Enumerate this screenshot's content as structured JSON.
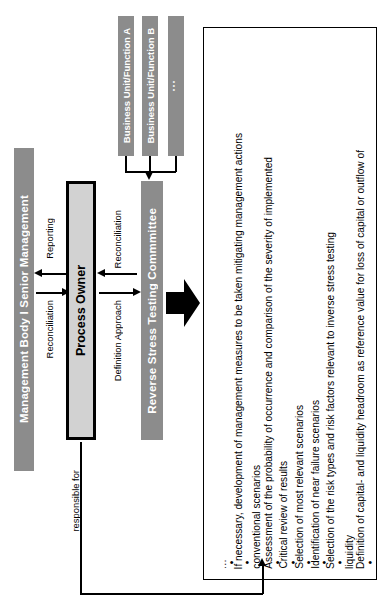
{
  "diagram": {
    "orientation": "rotated-90-ccw",
    "colors": {
      "grey_bar": "#8c8c8c",
      "process_owner_fill": "#d2d2d2",
      "outline": "#000000",
      "bar_text": "#ffffff"
    }
  },
  "management": {
    "label": "Management Body  I  Senior Management"
  },
  "process_owner": {
    "label": "Process Owner"
  },
  "committee": {
    "label": "Reverse Stress Testing Commmittee"
  },
  "business_units": [
    {
      "label": "Business Unit/Function A"
    },
    {
      "label": "Business Unit/Function B"
    },
    {
      "label": "..."
    }
  ],
  "connectors": {
    "reporting": "Reporting",
    "reconciliation_top": "Reconciliation",
    "definition_approach": "Definition Approach",
    "reconciliation_bottom": "Reconciliation",
    "responsible_for": "responsible for"
  },
  "activities": {
    "bullets": [
      {
        "bullet": "•",
        "text": "Definition of capital- and liquidity headroom as reference value for loss of capital or outflow of"
      },
      {
        "bullet": "",
        "text": "liquidity"
      },
      {
        "bullet": "•",
        "text": "Selection of the risk types and risk factors relevant to inverse stress testing"
      },
      {
        "bullet": "•",
        "text": "Identification of near failure scenarios"
      },
      {
        "bullet": "•",
        "text": "Selection of most relevant scenarios"
      },
      {
        "bullet": "•",
        "text": "Critical review of results"
      },
      {
        "bullet": "•",
        "text": "Assessment of the probability of occurrence and comparison of the severity of implemented"
      },
      {
        "bullet": "",
        "text": "conventional scenarios"
      },
      {
        "bullet": "•",
        "text": "If necessary, development of management measures to be taken mitigating management actions"
      },
      {
        "bullet": "•",
        "text": "…"
      }
    ]
  }
}
